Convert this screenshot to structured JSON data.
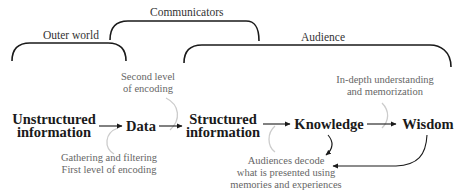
{
  "groups": {
    "outer_world": "Outer world",
    "communicators": "Communicators",
    "audience": "Audience"
  },
  "nodes": {
    "unstructured": [
      "Unstructured",
      "information"
    ],
    "data": "Data",
    "structured": [
      "Structured",
      "information"
    ],
    "knowledge": "Knowledge",
    "wisdom": "Wisdom"
  },
  "notes": {
    "second_level": [
      "Second level",
      "of encoding"
    ],
    "gathering": [
      "Gathering and filtering",
      "First level of encoding"
    ],
    "in_depth": [
      "In-depth understanding",
      "and memorization"
    ],
    "audiences_decode": [
      "Audiences decode",
      "what is presented using",
      "memories and experiences"
    ]
  },
  "colors": {
    "bracket": "#1a1a1a",
    "arrow": "#1a1a1a",
    "connector": "#cccccc",
    "note_text": "#666666"
  }
}
